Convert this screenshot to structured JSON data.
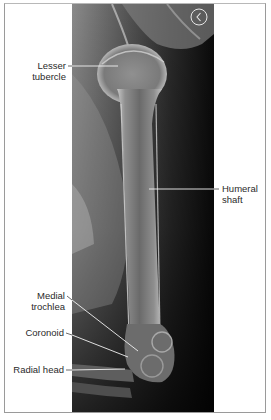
{
  "figure": {
    "side_marker": "L",
    "labels": {
      "lesser_tubercle": [
        "Lesser",
        "tubercle"
      ],
      "humeral_shaft": [
        "Humeral",
        "shaft"
      ],
      "medial_trochlea": [
        "Medial",
        "trochlea"
      ],
      "coronoid": "Coronoid",
      "radial_head": "Radial head"
    },
    "colors": {
      "frame_border": "#9a9a9a",
      "label_text": "#2a2a2a",
      "leader_line_on_image": "#f2f2f2",
      "leader_line_on_white": "#444444",
      "image_dark": "#0d0d0d"
    }
  }
}
